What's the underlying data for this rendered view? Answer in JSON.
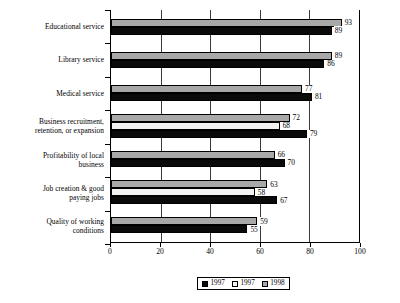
{
  "chart_data": {
    "type": "bar",
    "orientation": "horizontal",
    "title": "",
    "xlabel": "",
    "ylabel": "",
    "xlim": [
      0,
      100
    ],
    "xticks": [
      0,
      20,
      40,
      60,
      80,
      100
    ],
    "grid": true,
    "legend_position": "bottom",
    "categories": [
      "Educational service",
      "Library service",
      "Medical service",
      "Business recruitment, retention, or expansion",
      "Profitability of local business",
      "Job creation & good paying jobs",
      "Quality of working conditions"
    ],
    "series": [
      {
        "name": "1997",
        "key": "s1997b",
        "color": "#0a0a0a",
        "values": [
          89,
          86,
          81,
          79,
          70,
          67,
          55
        ]
      },
      {
        "name": "1997",
        "key": "s1997w",
        "color": "#f2f2f2",
        "values": [
          null,
          null,
          null,
          68,
          null,
          58,
          null
        ]
      },
      {
        "name": "1998",
        "key": "s1998",
        "color": "#a8a8a8",
        "values": [
          93,
          89,
          77,
          72,
          66,
          63,
          59
        ]
      }
    ]
  },
  "categories_display": [
    {
      "lines": [
        "Educational service"
      ]
    },
    {
      "lines": [
        "Library service"
      ]
    },
    {
      "lines": [
        "Medical service"
      ]
    },
    {
      "lines": [
        "Business recruitment,",
        "retention, or expansion"
      ]
    },
    {
      "lines": [
        "Profitability of local",
        "business"
      ]
    },
    {
      "lines": [
        "Job creation & good",
        "paying jobs"
      ]
    },
    {
      "lines": [
        "Quality of working",
        "conditions"
      ]
    }
  ],
  "groups": [
    {
      "category": "Educational service",
      "bars": [
        {
          "series": "1998",
          "key": "s1998",
          "value": 93,
          "label": "93"
        },
        {
          "series": "1997",
          "key": "s1997b",
          "value": 89,
          "label": "89"
        }
      ]
    },
    {
      "category": "Library service",
      "bars": [
        {
          "series": "1998",
          "key": "s1998",
          "value": 89,
          "label": "89"
        },
        {
          "series": "1997",
          "key": "s1997b",
          "value": 86,
          "label": "86"
        }
      ]
    },
    {
      "category": "Medical service",
      "bars": [
        {
          "series": "1998",
          "key": "s1998",
          "value": 77,
          "label": "77"
        },
        {
          "series": "1997",
          "key": "s1997b",
          "value": 81,
          "label": "81"
        }
      ]
    },
    {
      "category": "Business recruitment, retention, or expansion",
      "bars": [
        {
          "series": "1998",
          "key": "s1998",
          "value": 72,
          "label": "72"
        },
        {
          "series": "1997",
          "key": "s1997w",
          "value": 68,
          "label": "68"
        },
        {
          "series": "1997",
          "key": "s1997b",
          "value": 79,
          "label": "79"
        }
      ]
    },
    {
      "category": "Profitability of local business",
      "bars": [
        {
          "series": "1998",
          "key": "s1998",
          "value": 66,
          "label": "66"
        },
        {
          "series": "1997",
          "key": "s1997b",
          "value": 70,
          "label": "70"
        }
      ]
    },
    {
      "category": "Job creation & good paying jobs",
      "bars": [
        {
          "series": "1998",
          "key": "s1998",
          "value": 63,
          "label": "63"
        },
        {
          "series": "1997",
          "key": "s1997w",
          "value": 58,
          "label": "58"
        },
        {
          "series": "1997",
          "key": "s1997b",
          "value": 67,
          "label": "67"
        }
      ]
    },
    {
      "category": "Quality of working conditions",
      "bars": [
        {
          "series": "1998",
          "key": "s1998",
          "value": 59,
          "label": "59"
        },
        {
          "series": "1997",
          "key": "s1997b",
          "value": 55,
          "label": "55"
        }
      ]
    }
  ],
  "x_axis": {
    "ticks": [
      {
        "value": 0,
        "label": "0"
      },
      {
        "value": 20,
        "label": "20"
      },
      {
        "value": 40,
        "label": "40"
      },
      {
        "value": 60,
        "label": "60"
      },
      {
        "value": 80,
        "label": "80"
      },
      {
        "value": 100,
        "label": "100"
      }
    ],
    "min": 0,
    "max": 100
  },
  "legend": {
    "items": [
      {
        "label": "1997",
        "key": "s1997b",
        "color": "#0a0a0a"
      },
      {
        "label": "1997",
        "key": "s1997w",
        "color": "#f2f2f2"
      },
      {
        "label": "1998",
        "key": "s1998",
        "color": "#a8a8a8"
      }
    ]
  },
  "colors": {
    "series_1997_black": "#0a0a0a",
    "series_1997_white": "#f2f2f2",
    "series_1998_gray": "#a8a8a8",
    "axis": "#000000",
    "background": "#ffffff"
  }
}
